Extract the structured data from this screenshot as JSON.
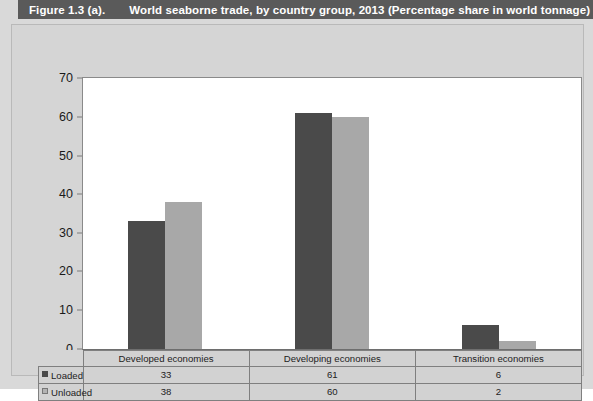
{
  "header": {
    "figure_number": "Figure 1.3 (a).",
    "title": "World seaborne trade, by country group, 2013 (Percentage share in world tonnage)"
  },
  "chart_data": {
    "type": "bar",
    "title": "World seaborne trade, by country group, 2013 (Percentage share in world tonnage)",
    "categories": [
      "Developed economies",
      "Developing economies",
      "Transition economies"
    ],
    "series": [
      {
        "name": "Loaded",
        "values": [
          33,
          61,
          6
        ],
        "color": "#4a4a4a"
      },
      {
        "name": "Unloaded",
        "values": [
          38,
          60,
          2
        ],
        "color": "#a8a8a8"
      }
    ],
    "xlabel": "",
    "ylabel": "",
    "ylim": [
      0,
      70
    ],
    "yticks": [
      0,
      10,
      20,
      30,
      40,
      50,
      60,
      70
    ],
    "ytick_labels": [
      "0",
      "10",
      "20",
      "30",
      "40",
      "50",
      "60",
      "70"
    ],
    "grid": false,
    "legend_position": "bottom-table"
  },
  "table": {
    "row_header_blank": "",
    "column_headers": [
      "Developed economies",
      "Developing economies",
      "Transition economies"
    ],
    "rows": [
      {
        "label": "Loaded",
        "swatch": "dark-square-icon",
        "values": [
          "33",
          "61",
          "6"
        ]
      },
      {
        "label": "Unloaded",
        "swatch": "light-square-icon",
        "values": [
          "38",
          "60",
          "2"
        ]
      }
    ]
  },
  "colors": {
    "header_bar": "#5a5a5a",
    "page_background": "#d9d9d9",
    "card_background": "#d5d5d5",
    "plot_background": "#ffffff",
    "loaded": "#4a4a4a",
    "unloaded": "#a8a8a8"
  }
}
